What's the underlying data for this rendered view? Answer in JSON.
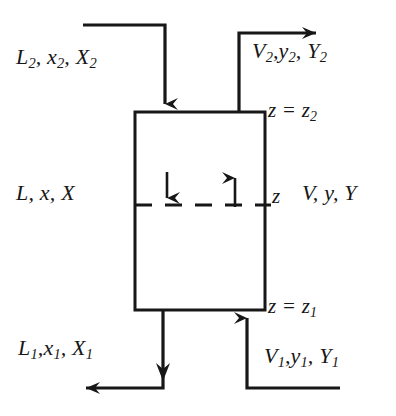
{
  "figure": {
    "background_color": "#ffffff",
    "line_color": "#171717",
    "width": 396,
    "height": 416
  },
  "column": {
    "name": "mass-transfer-column",
    "left": 135,
    "right": 265,
    "top": 112,
    "bottom": 310,
    "section_line_y": 205
  },
  "labels": {
    "liquid_top": {
      "main": "L",
      "sub": "2",
      "second": "x",
      "second_sub": "2",
      "third": "X",
      "third_sub": "2",
      "text": "L2, x2, X2"
    },
    "vapor_top": {
      "main": "V",
      "sub": "2",
      "second": "y",
      "second_sub": "2",
      "third": "Y",
      "third_sub": "2",
      "text": "V2, y2, Y2"
    },
    "liquid_mid": {
      "text": "L, x, X"
    },
    "vapor_mid": {
      "text": "V, y, Y"
    },
    "liquid_bottom": {
      "main": "L",
      "sub": "1",
      "second": "x",
      "second_sub": "1",
      "third": "X",
      "third_sub": "1",
      "text": "L1, x1, X1"
    },
    "vapor_bottom": {
      "main": "V",
      "sub": "1",
      "second": "y",
      "second_sub": "1",
      "third": "Y",
      "third_sub": "1",
      "text": "V1, y1, Y1"
    },
    "z_top": {
      "var": "z",
      "equals": "=",
      "value": "z",
      "value_sub": "2",
      "text": "z = z2"
    },
    "z_mid": {
      "text": "z"
    },
    "z_bottom": {
      "var": "z",
      "equals": "=",
      "value": "z",
      "value_sub": "1",
      "text": "z = z1"
    }
  },
  "streams": [
    {
      "name": "liquid-inlet-top",
      "direction": "down",
      "phase": "liquid",
      "enters": "top"
    },
    {
      "name": "vapor-outlet-top",
      "direction": "right",
      "phase": "vapor",
      "exits": "top"
    },
    {
      "name": "liquid-outlet-bottom",
      "direction": "left",
      "phase": "liquid",
      "exits": "bottom"
    },
    {
      "name": "vapor-inlet-bottom",
      "direction": "up",
      "phase": "vapor",
      "enters": "bottom"
    },
    {
      "name": "internal-liquid-flow",
      "direction": "down",
      "phase": "liquid"
    },
    {
      "name": "internal-vapor-flow",
      "direction": "up",
      "phase": "vapor"
    }
  ]
}
